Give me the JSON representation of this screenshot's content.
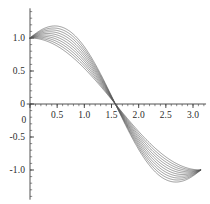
{
  "chart_data": {
    "type": "line",
    "title": "",
    "subtitle": "",
    "xlabel": "",
    "ylabel": "",
    "xlim": [
      -0.06,
      3.24
    ],
    "ylim": [
      -1.45,
      1.45
    ],
    "grid": false,
    "legend": null,
    "legend_position": "none",
    "x_ticks": [
      0,
      0.5,
      1.0,
      1.5,
      2.0,
      2.5,
      3.0
    ],
    "x_tick_labels": [
      "0",
      "0.5",
      "1.0",
      "1.5",
      "2.0",
      "2.5",
      "3.0"
    ],
    "y_ticks": [
      -1.0,
      -0.5,
      0,
      0.5,
      1.0
    ],
    "y_tick_labels": [
      "-1.0",
      "-0.5",
      "0",
      "0.5",
      "1.0"
    ],
    "x_minor_tick_step": 0.1,
    "y_minor_tick_step": 0.1,
    "x_domain": [
      0,
      3.14159
    ],
    "n_series": 10,
    "series_color": "#555555",
    "axis_color": "#404040",
    "formula": "y(x) = cos(x) + a*sin(2x)",
    "series": [
      {
        "name": "a = 0.00",
        "a": 0.0,
        "values_x": [
          0,
          0.393,
          0.785,
          1.178,
          1.571,
          1.963,
          2.356,
          2.749,
          3.142
        ],
        "values_y": [
          1.0,
          0.924,
          0.707,
          0.383,
          0.0,
          -0.383,
          -0.707,
          -0.924,
          -1.0
        ]
      },
      {
        "name": "a = 0.04",
        "a": 0.04,
        "values_x": [
          0,
          0.393,
          0.785,
          1.178,
          1.571,
          1.963,
          2.356,
          2.749,
          3.142
        ],
        "values_y": [
          1.0,
          0.952,
          0.747,
          0.411,
          0.0,
          -0.411,
          -0.747,
          -0.952,
          -1.0
        ]
      },
      {
        "name": "a = 0.08",
        "a": 0.08,
        "values_x": [
          0,
          0.393,
          0.785,
          1.178,
          1.571,
          1.963,
          2.356,
          2.749,
          3.142
        ],
        "values_y": [
          1.0,
          0.981,
          0.787,
          0.44,
          0.0,
          -0.44,
          -0.787,
          -0.981,
          -1.0
        ]
      },
      {
        "name": "a = 0.12",
        "a": 0.12,
        "values_x": [
          0,
          0.393,
          0.785,
          1.178,
          1.571,
          1.963,
          2.356,
          2.749,
          3.142
        ],
        "values_y": [
          1.0,
          1.009,
          0.827,
          0.468,
          0.0,
          -0.468,
          -0.827,
          -1.009,
          -1.0
        ]
      },
      {
        "name": "a = 0.16",
        "a": 0.16,
        "values_x": [
          0,
          0.393,
          0.785,
          1.178,
          1.571,
          1.963,
          2.356,
          2.749,
          3.142
        ],
        "values_y": [
          1.0,
          1.037,
          0.867,
          0.496,
          0.0,
          -0.496,
          -0.867,
          -1.037,
          -1.0
        ]
      },
      {
        "name": "a = 0.20",
        "a": 0.2,
        "values_x": [
          0,
          0.393,
          0.785,
          1.178,
          1.571,
          1.963,
          2.356,
          2.749,
          3.142
        ],
        "values_y": [
          1.0,
          1.066,
          0.907,
          0.524,
          0.0,
          -0.524,
          -0.907,
          -1.066,
          -1.0
        ]
      },
      {
        "name": "a = 0.24",
        "a": 0.24,
        "values_x": [
          0,
          0.393,
          0.785,
          1.178,
          1.571,
          1.963,
          2.356,
          2.749,
          3.142
        ],
        "values_y": [
          1.0,
          1.094,
          0.947,
          0.553,
          0.0,
          -0.553,
          -0.947,
          -1.094,
          -1.0
        ]
      },
      {
        "name": "a = 0.28",
        "a": 0.28,
        "values_x": [
          0,
          0.393,
          0.785,
          1.178,
          1.571,
          1.963,
          2.356,
          2.749,
          3.142
        ],
        "values_y": [
          1.0,
          1.122,
          0.987,
          0.581,
          0.0,
          -0.581,
          -0.987,
          -1.122,
          -1.0
        ]
      },
      {
        "name": "a = 0.32",
        "a": 0.32,
        "values_x": [
          0,
          0.393,
          0.785,
          1.178,
          1.571,
          1.963,
          2.356,
          2.749,
          3.142
        ],
        "values_y": [
          1.0,
          1.151,
          1.027,
          0.609,
          0.0,
          -0.609,
          -1.027,
          -1.151,
          -1.0
        ]
      },
      {
        "name": "a = 0.36",
        "a": 0.36,
        "values_x": [
          0,
          0.393,
          0.785,
          1.178,
          1.571,
          1.963,
          2.356,
          2.749,
          3.142
        ],
        "values_y": [
          1.0,
          1.179,
          1.067,
          0.637,
          0.0,
          -0.637,
          -1.067,
          -1.179,
          -1.0
        ]
      }
    ]
  }
}
